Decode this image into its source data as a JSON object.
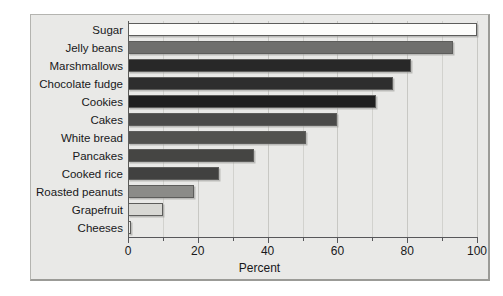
{
  "chart_data": {
    "type": "bar",
    "orientation": "horizontal",
    "title": "",
    "xlabel": "Percent",
    "ylabel": "",
    "xlim": [
      0,
      100
    ],
    "grid": true,
    "legend": null,
    "xticks": [
      0,
      20,
      40,
      60,
      80,
      100
    ],
    "xtick_labels": [
      "0",
      "20",
      "40",
      "60",
      "80",
      "100"
    ],
    "minor_xticks": [
      10,
      30,
      50,
      70,
      90
    ],
    "categories": [
      "Sugar",
      "Jelly beans",
      "Marshmallows",
      "Chocolate fudge",
      "Cookies",
      "Cakes",
      "White bread",
      "Pancakes",
      "Cooked rice",
      "Roasted peanuts",
      "Grapefruit",
      "Cheeses"
    ],
    "values": [
      100,
      93,
      81,
      76,
      71,
      60,
      51,
      36,
      26,
      19,
      10,
      1
    ],
    "bar_colors": [
      "#fdfdfb",
      "#6f6f6d",
      "#282828",
      "#2e2e2e",
      "#1f1f1f",
      "#4a4a49",
      "#52524f",
      "#454543",
      "#414140",
      "#8b8b88",
      "#d8d8d4",
      "#ececea"
    ]
  },
  "axis": {
    "x_title": "Percent"
  }
}
